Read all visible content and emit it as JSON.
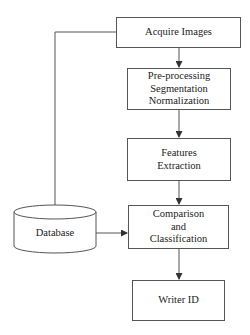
{
  "diagram": {
    "type": "flowchart",
    "nodes": [
      {
        "id": "acquire",
        "shape": "rectangle",
        "lines": [
          "Acquire Images"
        ]
      },
      {
        "id": "preprocess",
        "shape": "rectangle",
        "lines": [
          "Pre-processing",
          "Segmentation",
          "Normalization"
        ]
      },
      {
        "id": "features",
        "shape": "rectangle",
        "lines": [
          "Features",
          "Extraction"
        ]
      },
      {
        "id": "compare",
        "shape": "rectangle",
        "lines": [
          "Comparison",
          "and",
          "Classification"
        ]
      },
      {
        "id": "writer",
        "shape": "rectangle",
        "lines": [
          "Writer ID"
        ]
      },
      {
        "id": "database",
        "shape": "cylinder",
        "lines": [
          "Database"
        ]
      }
    ],
    "edges": [
      {
        "from": "acquire",
        "to": "preprocess"
      },
      {
        "from": "preprocess",
        "to": "features"
      },
      {
        "from": "features",
        "to": "compare"
      },
      {
        "from": "compare",
        "to": "writer"
      },
      {
        "from": "acquire",
        "to": "database"
      },
      {
        "from": "database",
        "to": "compare"
      }
    ],
    "colors": {
      "stroke": "#555555",
      "background": "#ffffff",
      "text": "#222222"
    }
  }
}
